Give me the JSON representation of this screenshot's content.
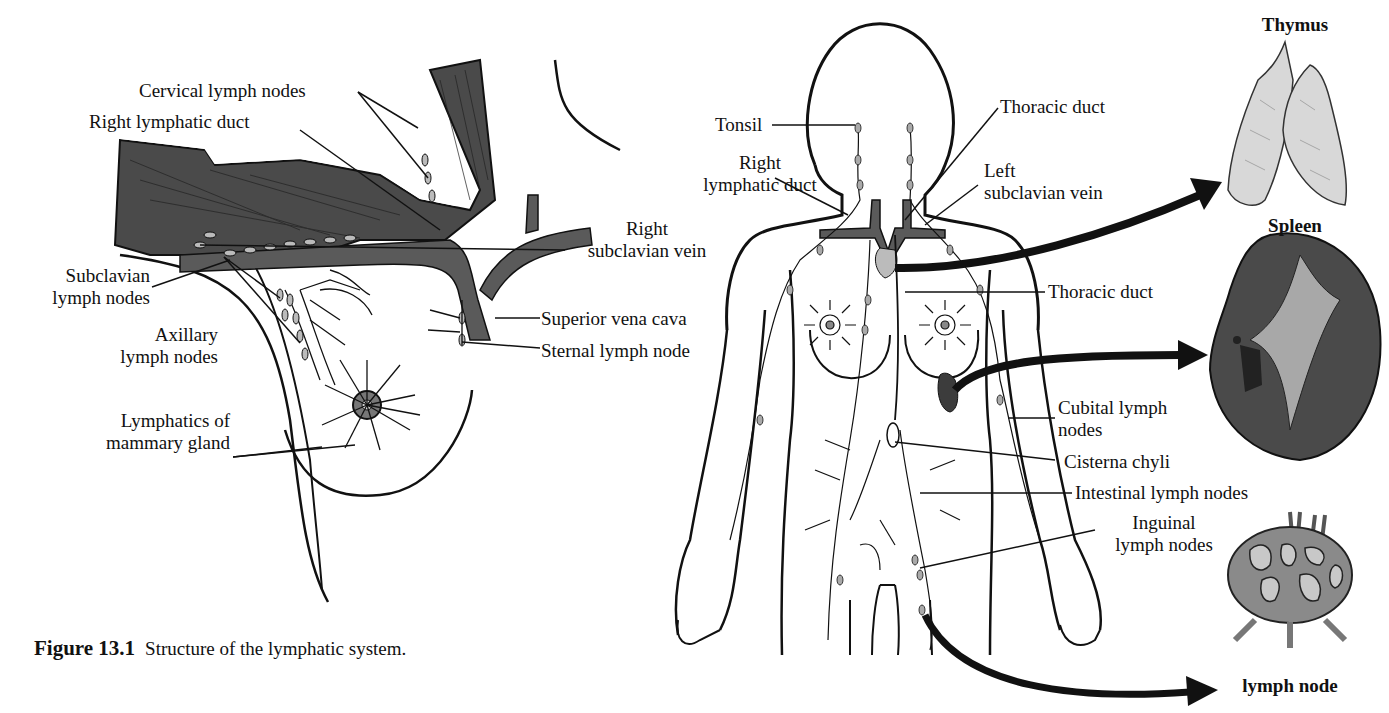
{
  "figure": {
    "number": "Figure 13.1",
    "caption": "Structure of the lymphatic system."
  },
  "left_panel": {
    "labels": {
      "cervical_lymph_nodes": "Cervical lymph nodes",
      "right_lymphatic_duct": "Right lymphatic duct",
      "subclavian_lymph_nodes_1": "Subclavian",
      "subclavian_lymph_nodes_2": "lymph nodes",
      "axillary_lymph_nodes_1": "Axillary",
      "axillary_lymph_nodes_2": "lymph nodes",
      "lymphatics_mammary_1": "Lymphatics of",
      "lymphatics_mammary_2": "mammary gland",
      "right_subclavian_vein_1": "Right",
      "right_subclavian_vein_2": "subclavian vein",
      "superior_vena_cava": "Superior vena cava",
      "sternal_lymph_node": "Sternal lymph node"
    }
  },
  "body_panel": {
    "labels": {
      "tonsil": "Tonsil",
      "right_lymphatic_duct_1": "Right",
      "right_lymphatic_duct_2": "lymphatic duct",
      "thoracic_duct_top": "Thoracic duct",
      "left_subclavian_vein_1": "Left",
      "left_subclavian_vein_2": "subclavian vein",
      "thoracic_duct_mid": "Thoracic duct",
      "cubital_lymph_nodes_1": "Cubital lymph",
      "cubital_lymph_nodes_2": "nodes",
      "cisterna_chyli": "Cisterna chyli",
      "intestinal_lymph_nodes": "Intestinal lymph nodes",
      "inguinal_lymph_nodes_1": "Inguinal",
      "inguinal_lymph_nodes_2": "lymph nodes"
    }
  },
  "organs": {
    "thymus": "Thymus",
    "spleen": "Spleen",
    "lymph_node": "lymph node"
  },
  "colors": {
    "ink": "#111111",
    "muscle": "#4a4a4a",
    "vein": "#5a5a5a",
    "organ_light": "#d8d8d8",
    "spleen_dark": "#3c3c3c"
  }
}
